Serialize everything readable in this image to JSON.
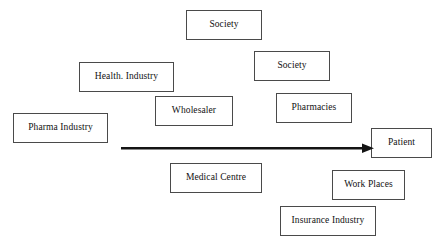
{
  "diagram": {
    "type": "flow-diagram",
    "background_color": "#ffffff",
    "box_border_color": "#4a4a4a",
    "text_color": "#111111",
    "arrow": {
      "name": "flow-arrow",
      "direction": "left-to-right",
      "color": "#141414",
      "from_x": 121,
      "to_x": 371,
      "y": 148,
      "thickness": 2.5,
      "source_node": "Pharma Industry",
      "target_node": "Patient"
    },
    "nodes": [
      {
        "id": "society-top",
        "label": "Society",
        "x": 186,
        "y": 10,
        "w": 76,
        "h": 30
      },
      {
        "id": "society-second",
        "label": "Society",
        "x": 254,
        "y": 51,
        "w": 76,
        "h": 30
      },
      {
        "id": "health-industry",
        "label": "Health. Industry",
        "x": 79,
        "y": 62,
        "w": 95,
        "h": 30
      },
      {
        "id": "wholesaler",
        "label": "Wholesaler",
        "x": 155,
        "y": 96,
        "w": 78,
        "h": 30
      },
      {
        "id": "pharmacies",
        "label": "Pharmacies",
        "x": 276,
        "y": 93,
        "w": 76,
        "h": 30
      },
      {
        "id": "pharma-industry",
        "label": "Pharma Industry",
        "x": 13,
        "y": 113,
        "w": 95,
        "h": 30
      },
      {
        "id": "patient",
        "label": "Patient",
        "x": 371,
        "y": 128,
        "w": 61,
        "h": 30
      },
      {
        "id": "medical-centre",
        "label": "Medical Centre",
        "x": 170,
        "y": 163,
        "w": 92,
        "h": 30
      },
      {
        "id": "work-places",
        "label": "Work Places",
        "x": 332,
        "y": 170,
        "w": 73,
        "h": 30
      },
      {
        "id": "insurance-industry",
        "label": "Insurance Industry",
        "x": 280,
        "y": 206,
        "w": 96,
        "h": 30
      }
    ]
  }
}
